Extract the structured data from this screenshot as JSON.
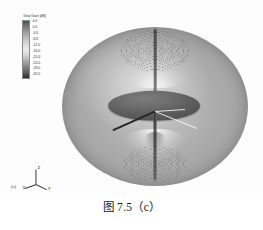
{
  "figure": {
    "caption": "图 7.5（c）",
    "subfigure_label": "(c)"
  },
  "legend": {
    "title": "Total Gain [dB]",
    "unit": "dB",
    "ticks": [
      "4.0",
      "0.0",
      "-4.0",
      "-8.0",
      "-12.0",
      "-16.0",
      "-20.0",
      "-24.0",
      "-28.0",
      "-32.0"
    ],
    "colormap": "grayscale"
  },
  "axes": {
    "z_label": "Z",
    "x_label": "X",
    "y_label": "Y"
  },
  "chart_data": {
    "type": "heatmap",
    "title": "Total Gain [dB]",
    "plot_kind": "3d-antenna-radiation-pattern",
    "colorbar_label": "Total Gain [dB]",
    "colorbar_ticks": [
      4.0,
      0.0,
      -4.0,
      -8.0,
      -12.0,
      -16.0,
      -20.0,
      -24.0,
      -28.0,
      -32.0
    ],
    "colorbar_range": [
      -32.0,
      4.0
    ],
    "colorbar_step": 4.0,
    "colormap": "grayscale",
    "axis_labels": [
      "X",
      "Y",
      "Z"
    ],
    "grid": true,
    "legend_position": "top-left",
    "features": [
      {
        "name": "null-top-pole",
        "direction_deg_theta": 0,
        "gain_db": -32.0
      },
      {
        "name": "null-bottom-pole",
        "direction_deg_theta": 180,
        "gain_db": -32.0
      },
      {
        "name": "peak-horizontal-plane",
        "direction_deg_theta": 90,
        "gain_db": 4.0
      }
    ]
  }
}
